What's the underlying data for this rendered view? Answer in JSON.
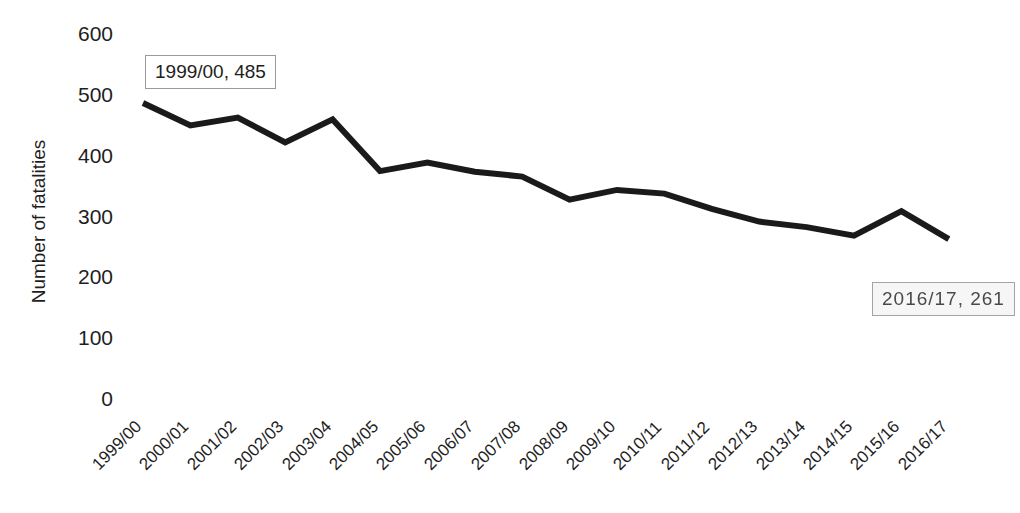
{
  "chart_data": {
    "type": "line",
    "title": "",
    "xlabel": "",
    "ylabel": "Number of fatalities",
    "ylim": [
      0,
      600
    ],
    "ytick_labels": [
      "600",
      "500",
      "400",
      "300",
      "200",
      "100",
      "0"
    ],
    "ytick_values": [
      600,
      500,
      400,
      300,
      200,
      100,
      0
    ],
    "grid": false,
    "legend": "none",
    "line_color": "#1a1a1a",
    "categories": [
      "1999/00",
      "2000/01",
      "2001/02",
      "2002/03",
      "2003/04",
      "2004/05",
      "2005/06",
      "2006/07",
      "2007/08",
      "2008/09",
      "2009/10",
      "2010/11",
      "2011/12",
      "2012/13",
      "2013/14",
      "2014/15",
      "2015/16",
      "2016/17"
    ],
    "values": [
      485,
      448,
      461,
      420,
      458,
      373,
      387,
      372,
      364,
      326,
      342,
      336,
      311,
      290,
      281,
      267,
      307,
      261
    ],
    "series": [
      {
        "name": "Number of fatalities",
        "values": [
          485,
          448,
          461,
          420,
          458,
          373,
          387,
          372,
          364,
          326,
          342,
          336,
          311,
          290,
          281,
          267,
          307,
          261
        ]
      }
    ],
    "annotations": [
      {
        "text": "1999/00, 485",
        "category": "1999/00",
        "value": 485
      },
      {
        "text": "2016/17, 261",
        "category": "2016/17",
        "value": 261
      }
    ]
  },
  "y_axis": {
    "title": "Number of fatalities",
    "ticks": [
      {
        "label": "600",
        "value": 600
      },
      {
        "label": "500",
        "value": 500
      },
      {
        "label": "400",
        "value": 400
      },
      {
        "label": "300",
        "value": 300
      },
      {
        "label": "200",
        "value": 200
      },
      {
        "label": "100",
        "value": 100
      },
      {
        "label": "0",
        "value": 0
      }
    ]
  },
  "x_axis": {
    "ticks": [
      {
        "label": "1999/00"
      },
      {
        "label": "2000/01"
      },
      {
        "label": "2001/02"
      },
      {
        "label": "2002/03"
      },
      {
        "label": "2003/04"
      },
      {
        "label": "2004/05"
      },
      {
        "label": "2005/06"
      },
      {
        "label": "2006/07"
      },
      {
        "label": "2007/08"
      },
      {
        "label": "2008/09"
      },
      {
        "label": "2009/10"
      },
      {
        "label": "2010/11"
      },
      {
        "label": "2011/12"
      },
      {
        "label": "2012/13"
      },
      {
        "label": "2013/14"
      },
      {
        "label": "2014/15"
      },
      {
        "label": "2015/16"
      },
      {
        "label": "2016/17"
      }
    ]
  },
  "data_labels": [
    {
      "text": "1999/00, 485",
      "x": 145,
      "y": 55,
      "degraded": false
    },
    {
      "text": "2016/17, 261",
      "x": 872,
      "y": 282,
      "degraded": true
    }
  ]
}
